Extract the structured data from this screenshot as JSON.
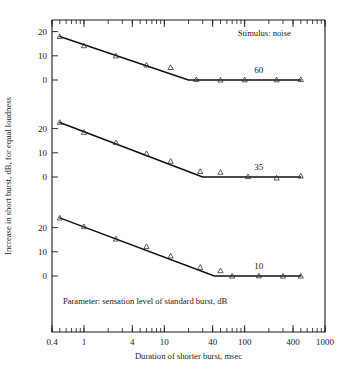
{
  "figure": {
    "background": "#ffffff",
    "ink_color": "#1a1a1a",
    "curve_color": "#111111"
  },
  "chart_data": {
    "type": "line",
    "title": "",
    "subtitle": "",
    "xlabel": "Duration of shorter burst, msec",
    "ylabel": "Increase in short burst, dB, for equal loudness",
    "xscale": "log",
    "xlim": [
      0.4,
      1000
    ],
    "xticks": [
      0.4,
      1,
      4,
      10,
      40,
      100,
      400,
      1000
    ],
    "xtick_labels": [
      "0.4",
      "1",
      "4",
      "10",
      "40",
      "100",
      "400",
      "1000"
    ],
    "grid": false,
    "legend_position": "inline-right-of-each-curve",
    "annotations": [
      {
        "name": "stimulus-note",
        "text": "Stimulus: noise",
        "x_frac": 0.68,
        "y_px": 36
      },
      {
        "name": "parameter-note",
        "text": "Parameter: sensation level of standard burst, dB",
        "x_frac": 0.04,
        "y_px": 304
      }
    ],
    "panels": [
      {
        "name": "panel-60",
        "series_label": "60",
        "sensation_level_dB": 60,
        "ylim": [
          -5,
          22
        ],
        "yticks": [
          0,
          10,
          20
        ],
        "ytick_labels": [
          "0",
          "10",
          "20"
        ],
        "baseline_px": 80,
        "px_per_dB": 2.42,
        "knee_x": 20,
        "fit_points_x": [
          0.5,
          20,
          500
        ],
        "fit_points_y": [
          18.0,
          0.0,
          0.0
        ],
        "x": [
          0.5,
          1.0,
          2.5,
          6.0,
          12.0,
          25.0,
          50.0,
          100.0,
          250.0,
          500.0
        ],
        "y": [
          18.0,
          14.2,
          10.0,
          6.2,
          5.2,
          0.2,
          0.0,
          0.1,
          0.1,
          0.2
        ],
        "marker": "triangle-open"
      },
      {
        "name": "panel-35",
        "series_label": "35",
        "sensation_level_dB": 35,
        "ylim": [
          -5,
          25
        ],
        "yticks": [
          0,
          10,
          20
        ],
        "ytick_labels": [
          "0",
          "10",
          "20"
        ],
        "baseline_px": 177,
        "px_per_dB": 2.42,
        "knee_x": 30,
        "fit_points_x": [
          0.5,
          30,
          500
        ],
        "fit_points_y": [
          22.5,
          0.0,
          0.0
        ],
        "x": [
          0.5,
          1.0,
          2.5,
          6.0,
          12.0,
          28.0,
          50.0,
          110.0,
          250.0,
          500.0
        ],
        "y": [
          22.6,
          18.5,
          14.2,
          9.7,
          6.5,
          2.3,
          2.0,
          0.2,
          -0.4,
          0.4
        ],
        "marker": "triangle-open"
      },
      {
        "name": "panel-10",
        "series_label": "10",
        "sensation_level_dB": 10,
        "ylim": [
          -5,
          26
        ],
        "yticks": [
          0,
          10,
          20
        ],
        "ytick_labels": [
          "0",
          "10",
          "20"
        ],
        "baseline_px": 276,
        "px_per_dB": 2.42,
        "knee_x": 42,
        "fit_points_x": [
          0.5,
          42,
          500
        ],
        "fit_points_y": [
          24.0,
          0.0,
          0.0
        ],
        "x": [
          0.5,
          1.0,
          2.5,
          6.0,
          12.0,
          28.0,
          50.0,
          70.0,
          150.0,
          300.0,
          500.0
        ],
        "y": [
          24.0,
          20.4,
          15.3,
          12.2,
          8.3,
          3.6,
          2.2,
          0.0,
          0.1,
          0.0,
          0.0
        ],
        "marker": "triangle-open"
      }
    ]
  }
}
